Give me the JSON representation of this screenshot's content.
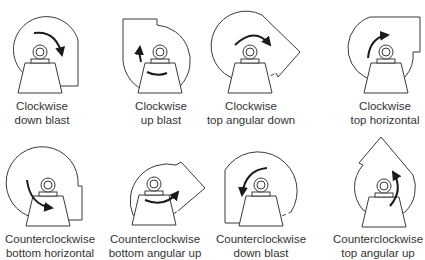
{
  "diagram": {
    "colors": {
      "line": "#3a3a3a",
      "text": "#333333",
      "background": "#ffffff"
    },
    "fans": [
      {
        "rotation": "Clockwise",
        "discharge": "down blast"
      },
      {
        "rotation": "Clockwise",
        "discharge": "up blast"
      },
      {
        "rotation": "Clockwise",
        "discharge": "top angular down"
      },
      {
        "rotation": "Clockwise",
        "discharge": "top horizontal"
      },
      {
        "rotation": "Counterclockwise",
        "discharge": "bottom horizontal"
      },
      {
        "rotation": "Counterclockwise",
        "discharge": "bottom angular up"
      },
      {
        "rotation": "Counterclockwise",
        "discharge": "down blast"
      },
      {
        "rotation": "Counterclockwise",
        "discharge": "top angular up"
      }
    ]
  }
}
